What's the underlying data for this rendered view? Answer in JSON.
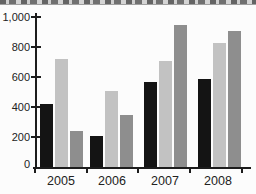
{
  "colors": {
    "background": "#fcfcfc",
    "axis": "#1c1c1c",
    "label_text": "#222222",
    "strip_background": "#c8c8c8",
    "strip_marks": "#4a4a4a"
  },
  "chart_data": {
    "type": "bar",
    "title": "",
    "xlabel": "",
    "ylabel": "",
    "categories": [
      "2005",
      "2006",
      "2007",
      "2008"
    ],
    "series": [
      {
        "name": "black-series",
        "color": "#141414",
        "values": [
          420,
          210,
          570,
          590
        ]
      },
      {
        "name": "light-gray-series",
        "color": "#c2c2c2",
        "values": [
          720,
          510,
          710,
          830
        ]
      },
      {
        "name": "medium-gray-series",
        "color": "#8e8e8e",
        "values": [
          240,
          350,
          950,
          910
        ]
      }
    ],
    "ylim": [
      0,
      1000
    ],
    "yticks": [
      0,
      200,
      400,
      600,
      800,
      1000
    ],
    "ytick_labels": [
      "0",
      "200",
      "400",
      "600",
      "800",
      "1,000"
    ],
    "legend": "none",
    "grid": false
  }
}
